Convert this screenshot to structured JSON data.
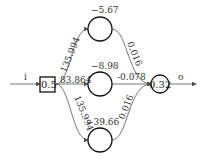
{
  "diagram": {
    "type": "neural-network",
    "input": {
      "label": "i",
      "value": "0.5"
    },
    "output": {
      "label": "o",
      "value": "0.32"
    },
    "hidden": [
      {
        "id": "h1",
        "bias": "−5.67"
      },
      {
        "id": "h2",
        "bias": "−8.98"
      },
      {
        "id": "h3",
        "bias": "−39.66"
      }
    ],
    "weights_in": [
      "135.994",
      "83.864",
      "135.994"
    ],
    "weights_out": [
      "0.016",
      "-0.078",
      "0.016"
    ],
    "colors": {
      "node_stroke": "#111111",
      "edge": "#555555",
      "text": "#333333"
    }
  }
}
